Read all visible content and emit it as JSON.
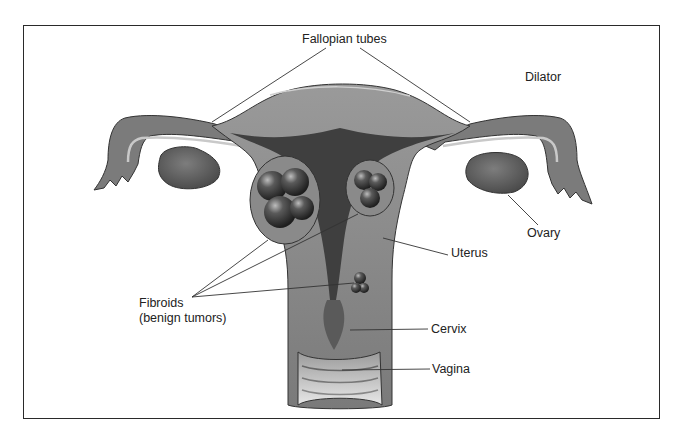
{
  "diagram": {
    "labels": {
      "fallopian_tubes": "Fallopian tubes",
      "dilator": "Dilator",
      "ovary": "Ovary",
      "uterus": "Uterus",
      "fibroids_line1": "Fibroids",
      "fibroids_line2": "(benign tumors)",
      "cervix": "Cervix",
      "vagina": "Vagina"
    },
    "colors": {
      "border": "#2a2a2a",
      "tissue_light": "#8a8a8a",
      "tissue_mid": "#6e6e6e",
      "cavity_dark": "#3f3f3f",
      "fibroid": "#2e2e2e",
      "leader_line": "#333333"
    }
  }
}
